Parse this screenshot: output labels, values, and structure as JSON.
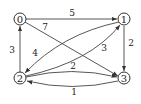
{
  "diagram": {
    "type": "directed-weighted-graph",
    "nodes": [
      {
        "id": "0",
        "label": "0",
        "x": 20,
        "y": 19
      },
      {
        "id": "1",
        "label": "1",
        "x": 124,
        "y": 19
      },
      {
        "id": "2",
        "label": "2",
        "x": 20,
        "y": 78
      },
      {
        "id": "3",
        "label": "3",
        "x": 124,
        "y": 78
      }
    ],
    "edges": [
      {
        "from": "0",
        "to": "1",
        "weight": "5",
        "label": "5"
      },
      {
        "from": "0",
        "to": "3",
        "weight": "7",
        "label": "7"
      },
      {
        "from": "1",
        "to": "2",
        "weight": "4",
        "label": "4"
      },
      {
        "from": "2",
        "to": "1",
        "weight": "3",
        "label": "3"
      },
      {
        "from": "2",
        "to": "0",
        "weight": "3",
        "label": "3"
      },
      {
        "from": "1",
        "to": "3",
        "weight": "2",
        "label": "2"
      },
      {
        "from": "2",
        "to": "3",
        "weight": "2",
        "label": "2"
      },
      {
        "from": "3",
        "to": "2",
        "weight": "1",
        "label": "1"
      }
    ]
  }
}
